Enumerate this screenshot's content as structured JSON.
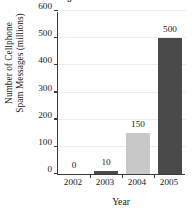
{
  "chart_data": {
    "type": "bar",
    "title": "Messages in the United States",
    "xlabel": "Year",
    "ylabel_line1": "Number of Cellphone",
    "ylabel_line2": "Spam Messages (millions)",
    "categories": [
      "2002",
      "2003",
      "2004",
      "2005"
    ],
    "values": [
      0,
      10,
      150,
      500
    ],
    "value_labels": [
      "0",
      "10",
      "150",
      "500"
    ],
    "bar_colors": [
      "#4a4a4a",
      "#4a4a4a",
      "#c8c8c8",
      "#4a4a4a"
    ],
    "ylim": [
      0,
      600
    ],
    "yticks": [
      0,
      100,
      200,
      300,
      400,
      500,
      600
    ],
    "ytick_labels": [
      "0",
      "100",
      "200",
      "300",
      "400",
      "500",
      "600"
    ],
    "grid": true,
    "legend": null,
    "axis_color": "#3a3a3a",
    "grid_color": "#ececec",
    "background": "#ffffff"
  }
}
